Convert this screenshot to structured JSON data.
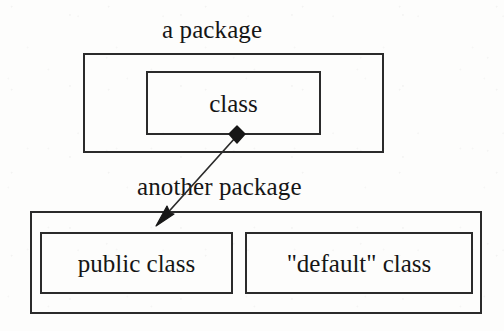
{
  "diagram": {
    "type": "uml-package-diagram",
    "background_color": "#fdfdfc",
    "stroke_color": "#2b2b2b",
    "text_color": "#161616",
    "packages": [
      {
        "id": "top",
        "label": "a package",
        "classes": [
          {
            "id": "class",
            "label": "class"
          }
        ]
      },
      {
        "id": "bottom",
        "label": "another package",
        "classes": [
          {
            "id": "public-class",
            "label": "public class"
          },
          {
            "id": "default-class",
            "label": "\"default\" class"
          }
        ]
      }
    ],
    "relationship": {
      "kind": "composition-association",
      "source_label": "class",
      "target_label": "public class",
      "source_end_marker": "filled-diamond",
      "target_end_marker": "filled-arrowhead",
      "source_point": {
        "x": 237,
        "y": 134
      },
      "target_point": {
        "x": 157,
        "y": 224
      }
    }
  }
}
